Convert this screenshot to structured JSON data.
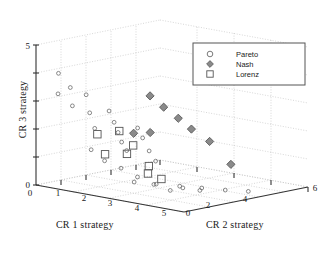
{
  "figure": {
    "background": "#ffffff",
    "width": 323,
    "height": 253
  },
  "axes": {
    "x": {
      "label": "CR 1 strategy",
      "ticks": [
        "1",
        "2",
        "3",
        "4",
        "5"
      ],
      "origin_label": "0",
      "range": [
        0,
        5
      ]
    },
    "y": {
      "label": "CR 2 strategy",
      "ticks": [
        "0",
        "2",
        "4",
        "6"
      ],
      "range": [
        0,
        6
      ]
    },
    "z": {
      "label": "CR 3 strategy",
      "ticks": [
        "0",
        "5"
      ],
      "range": [
        0,
        5
      ]
    }
  },
  "legend": {
    "border_color": "#555555",
    "background": "#ffffff",
    "entries": [
      {
        "label": "Pareto",
        "marker": "circle-open",
        "color": "#6b6b6b"
      },
      {
        "label": "Nash",
        "marker": "diamond-filled",
        "color": "#7d7d7d"
      },
      {
        "label": "Lorenz",
        "marker": "square-open",
        "color": "#5a5a5a"
      }
    ]
  },
  "style": {
    "grid_color": "#b9b9b9",
    "axis_color": "#3b3b3b",
    "pareto_color": "#6b6b6b",
    "nash_fill": "#8a8a8a",
    "nash_stroke": "#595959",
    "lorenz_color": "#555555",
    "tick_font_size": 9
  },
  "chart_data": {
    "type": "scatter",
    "title": "",
    "xlabel": "CR 1 strategy",
    "ylabel": "CR 2 strategy",
    "zlabel": "CR 3 strategy",
    "xlim": [
      0,
      5
    ],
    "ylim": [
      0,
      6
    ],
    "zlim": [
      0,
      5
    ],
    "grid": true,
    "legend_position": "upper-right",
    "projection": "3d",
    "series": [
      {
        "name": "Pareto",
        "marker": "circle-open",
        "points": [
          [
            0.55,
            0.3,
            4.05
          ],
          [
            0.95,
            0.3,
            3.62
          ],
          [
            0.5,
            0.35,
            3.3
          ],
          [
            0.95,
            0.4,
            2.95
          ],
          [
            1.45,
            0.35,
            3.45
          ],
          [
            1.5,
            0.45,
            2.8
          ],
          [
            1.6,
            0.55,
            2.25
          ],
          [
            2.05,
            0.6,
            2.95
          ],
          [
            2.15,
            0.7,
            2.55
          ],
          [
            2.25,
            0.75,
            2.2
          ],
          [
            2.3,
            0.85,
            1.85
          ],
          [
            2.4,
            0.95,
            1.55
          ],
          [
            2.7,
            1.05,
            2.4
          ],
          [
            2.8,
            1.15,
            2.05
          ],
          [
            2.95,
            1.25,
            1.6
          ],
          [
            3.1,
            1.35,
            1.25
          ],
          [
            1.2,
            0.95,
            1.35
          ],
          [
            1.55,
            1.1,
            1.0
          ],
          [
            2.0,
            1.25,
            0.8
          ],
          [
            2.45,
            1.4,
            0.55
          ],
          [
            2.9,
            1.55,
            0.35
          ],
          [
            3.35,
            1.7,
            0.2
          ],
          [
            1.85,
            2.1,
            0.15
          ],
          [
            2.35,
            2.45,
            0.12
          ],
          [
            2.9,
            2.8,
            0.1
          ],
          [
            3.4,
            3.15,
            0.08
          ],
          [
            3.95,
            3.5,
            0.06
          ],
          [
            4.45,
            3.9,
            0.05
          ],
          [
            3.6,
            1.95,
            0.3
          ],
          [
            4.0,
            2.2,
            0.25
          ]
        ]
      },
      {
        "name": "Nash",
        "marker": "diamond-filled",
        "points": [
          [
            3.05,
            1.15,
            3.6
          ],
          [
            3.3,
            1.45,
            3.2
          ],
          [
            3.55,
            1.8,
            2.8
          ],
          [
            3.75,
            2.15,
            2.4
          ],
          [
            2.95,
            1.3,
            2.25
          ],
          [
            4.05,
            2.6,
            1.95
          ],
          [
            4.35,
            3.2,
            1.1
          ],
          [
            2.6,
            1.0,
            2.2
          ]
        ]
      },
      {
        "name": "Lorenz",
        "marker": "square-open",
        "points": [
          [
            1.55,
            0.75,
            2.0
          ],
          [
            2.15,
            0.95,
            2.2
          ],
          [
            2.55,
            1.05,
            1.75
          ],
          [
            1.6,
            1.05,
            1.25
          ],
          [
            2.2,
            1.25,
            1.35
          ],
          [
            2.8,
            1.45,
            1.0
          ],
          [
            2.7,
            1.55,
            0.7
          ],
          [
            3.05,
            1.7,
            0.55
          ]
        ]
      }
    ]
  }
}
